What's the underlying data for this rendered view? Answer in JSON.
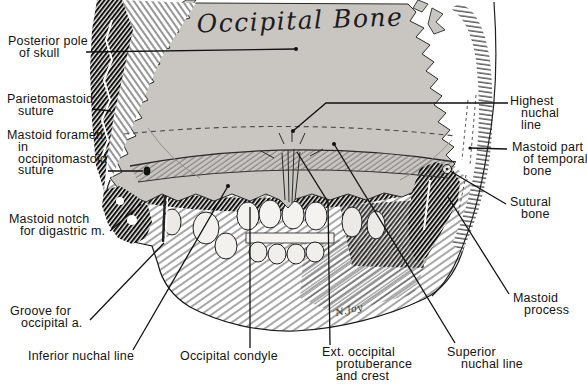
{
  "figure": {
    "title": "Occipital Bone",
    "signature": "N.Joy",
    "colors": {
      "bone_gray": "#c9c6c2",
      "ink": "#161616",
      "background": "#ffffff"
    }
  },
  "labels": {
    "posterior_pole": {
      "lines": [
        "Posterior pole",
        "of skull"
      ]
    },
    "parietomastoid_suture": {
      "lines": [
        "Parietomastoid",
        "suture"
      ]
    },
    "mastoid_foramen": {
      "lines": [
        "Mastoid foramen",
        "in",
        "occipitomastoid",
        "suture"
      ]
    },
    "mastoid_notch": {
      "lines": [
        "Mastoid notch",
        "for digastric m."
      ]
    },
    "groove_occipital_a": {
      "lines": [
        "Groove for",
        "occipital a."
      ]
    },
    "inferior_nuchal_line": {
      "lines": [
        "Inferior nuchal line"
      ]
    },
    "occipital_condyle": {
      "lines": [
        "Occipital condyle"
      ]
    },
    "ext_occipital_protuberance": {
      "lines": [
        "Ext. occipital",
        "protuberance",
        "and crest"
      ]
    },
    "superior_nuchal_line": {
      "lines": [
        "Superior",
        "nuchal line"
      ]
    },
    "highest_nuchal_line": {
      "lines": [
        "Highest",
        "nuchal",
        "line"
      ]
    },
    "mastoid_part_temporal": {
      "lines": [
        "Mastoid part",
        "of temporal",
        "bone"
      ]
    },
    "sutural_bone": {
      "lines": [
        "Sutural",
        "bone"
      ]
    },
    "mastoid_process": {
      "lines": [
        "Mastoid",
        "process"
      ]
    }
  }
}
